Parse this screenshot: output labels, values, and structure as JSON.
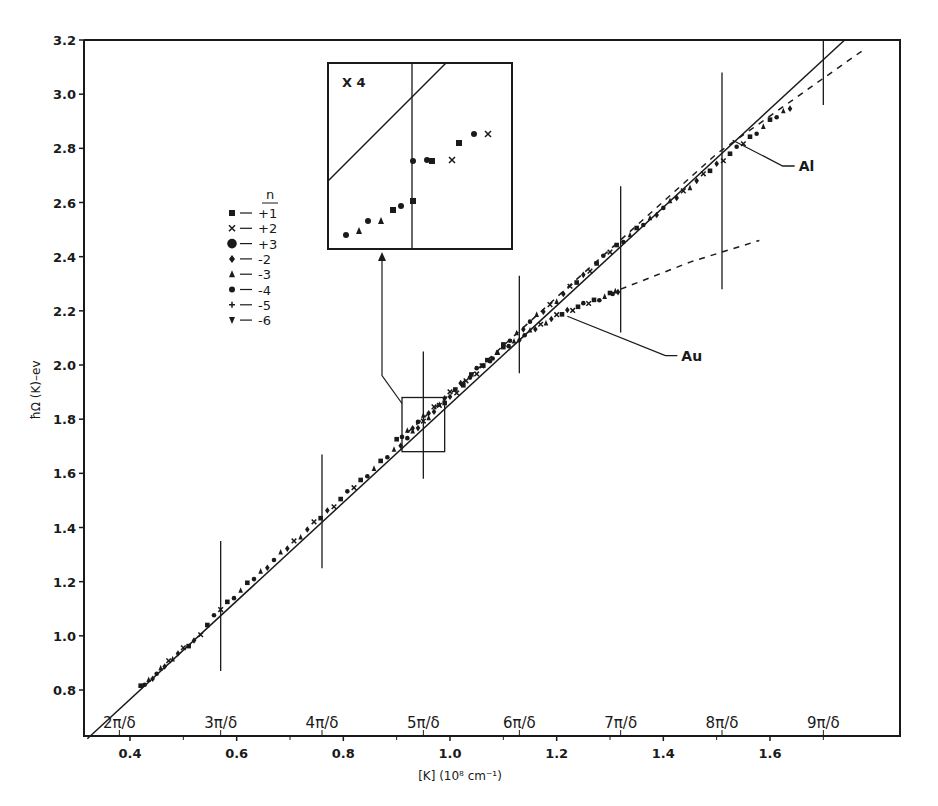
{
  "chart_data": {
    "type": "scatter",
    "title": "",
    "xlabel": "[K] (10⁸ cm⁻¹)",
    "ylabel": "ħΩ (K)–ev",
    "xlim": [
      0.32,
      1.85
    ],
    "ylim": [
      0.62,
      3.2
    ],
    "grid": false,
    "x_ticks": [
      0.4,
      0.6,
      0.8,
      1.0,
      1.2,
      1.4,
      1.6
    ],
    "x_tick_labels": [
      "0.4",
      "0.6",
      "0.8",
      "1.0",
      "1.2",
      "1.4",
      "1.6"
    ],
    "x_minor_ticks": [
      0.5,
      0.7,
      0.9,
      1.1,
      1.3,
      1.5,
      1.7
    ],
    "y_ticks": [
      0.8,
      1.0,
      1.2,
      1.4,
      1.6,
      1.8,
      2.0,
      2.2,
      2.4,
      2.6,
      2.8,
      3.0,
      3.2
    ],
    "y_tick_labels": [
      "0.8",
      "1.0",
      "1.2",
      "1.4",
      "1.6",
      "1.8",
      "2.0",
      "2.2",
      "2.4",
      "2.6",
      "2.8",
      "3.0",
      "3.2"
    ],
    "zone_markers": [
      {
        "label": "2π/δ",
        "x": 0.38
      },
      {
        "label": "3π/δ",
        "x": 0.57,
        "bar": [
          0.87,
          1.35
        ]
      },
      {
        "label": "4π/δ",
        "x": 0.76,
        "bar": [
          1.25,
          1.67
        ]
      },
      {
        "label": "5π/δ",
        "x": 0.95,
        "bar": [
          1.58,
          2.05
        ]
      },
      {
        "label": "6π/δ",
        "x": 1.13,
        "bar": [
          1.97,
          2.33
        ]
      },
      {
        "label": "7π/δ",
        "x": 1.32,
        "bar": [
          2.12,
          2.66
        ]
      },
      {
        "label": "8π/δ",
        "x": 1.51,
        "bar": [
          2.28,
          3.08
        ]
      },
      {
        "label": "9π/δ",
        "x": 1.7,
        "bar": [
          2.96,
          3.2
        ]
      }
    ],
    "series": [
      {
        "name": "Free-electron line",
        "style": "solid",
        "x": [
          0.32,
          1.74
        ],
        "y": [
          0.62,
          3.2
        ]
      },
      {
        "name": "Al",
        "style": "points",
        "x": [
          0.42,
          0.45,
          0.48,
          0.52,
          0.57,
          0.62,
          0.67,
          0.72,
          0.77,
          0.82,
          0.87,
          0.92,
          0.96,
          1.0,
          1.05,
          1.1,
          1.15,
          1.2,
          1.25,
          1.3,
          1.35,
          1.4,
          1.45,
          1.5,
          1.55,
          1.6,
          1.65
        ],
        "y": [
          0.81,
          0.86,
          0.92,
          0.98,
          1.1,
          1.19,
          1.28,
          1.37,
          1.46,
          1.55,
          1.64,
          1.73,
          1.81,
          1.88,
          1.97,
          2.07,
          2.16,
          2.24,
          2.33,
          2.42,
          2.5,
          2.58,
          2.66,
          2.74,
          2.82,
          2.9,
          2.97
        ]
      },
      {
        "name": "Al (extrapolated)",
        "style": "dashed",
        "x": [
          0.92,
          1.2,
          1.5,
          1.78
        ],
        "y": [
          1.75,
          2.25,
          2.78,
          3.17
        ]
      },
      {
        "name": "Au",
        "style": "points",
        "x": [
          0.9,
          0.94,
          0.98,
          1.02,
          1.06,
          1.1,
          1.14,
          1.18,
          1.22,
          1.26,
          1.3,
          1.32
        ],
        "y": [
          1.72,
          1.79,
          1.86,
          1.93,
          2.0,
          2.06,
          2.11,
          2.16,
          2.2,
          2.23,
          2.26,
          2.28
        ]
      },
      {
        "name": "Au (extrapolated)",
        "style": "dashed",
        "x": [
          1.32,
          1.45,
          1.58
        ],
        "y": [
          2.28,
          2.38,
          2.46
        ]
      }
    ],
    "legend": {
      "title": "n",
      "position": "upper-left",
      "entries": [
        {
          "marker": "square",
          "label": "+1"
        },
        {
          "marker": "x",
          "label": "+2"
        },
        {
          "marker": "large-circle",
          "label": "+3"
        },
        {
          "marker": "diamond",
          "label": "-2"
        },
        {
          "marker": "triangle-up",
          "label": "-3"
        },
        {
          "marker": "circle",
          "label": "-4"
        },
        {
          "marker": "plus",
          "label": "-5"
        },
        {
          "marker": "triangle-down",
          "label": "-6"
        }
      ]
    },
    "annotations": [
      {
        "text": "Al",
        "x": 1.65,
        "y": 2.72,
        "points_to": [
          1.53,
          2.83
        ]
      },
      {
        "text": "Au",
        "x": 1.43,
        "y": 2.02,
        "points_to": [
          1.22,
          2.18
        ]
      },
      {
        "text": "X 4",
        "note": "inset magnification of boxed region near 5π/δ"
      }
    ],
    "inset": {
      "label": "X 4",
      "source_box_x": [
        0.91,
        0.99
      ],
      "source_box_y": [
        1.68,
        1.88
      ]
    }
  }
}
